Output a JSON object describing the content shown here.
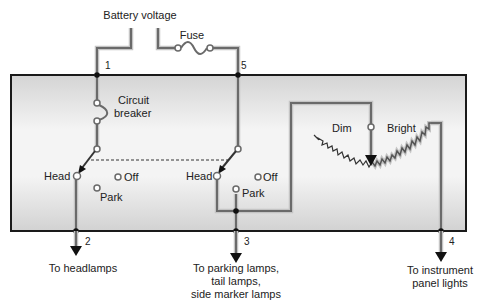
{
  "diagram": {
    "type": "headlamp switch circuit schematic",
    "labels": {
      "battery_voltage": "Battery voltage",
      "fuse": "Fuse",
      "circuit_breaker_line1": "Circuit",
      "circuit_breaker_line2": "breaker",
      "head_left": "Head",
      "off_left": "Off",
      "park_left": "Park",
      "head_right": "Head",
      "off_right": "Off",
      "park_right": "Park",
      "dim": "Dim",
      "bright": "Bright"
    },
    "terminals": {
      "t1": "1",
      "t2": "2",
      "t3": "3",
      "t4": "4",
      "t5": "5"
    },
    "outputs": {
      "headlamps": "To headlamps",
      "parking_line1": "To parking lamps,",
      "parking_line2": "tail lamps,",
      "parking_line3": "side marker lamps",
      "instrument_line1": "To instrument",
      "instrument_line2": "panel lights"
    },
    "colors": {
      "wire": "#6e6e6e",
      "wire_glow": "#b8b8b8",
      "box_border": "#1a1a1a",
      "panel_light": "#f6f6f6",
      "panel_dark": "#d6d6d6",
      "text": "#222222"
    }
  }
}
